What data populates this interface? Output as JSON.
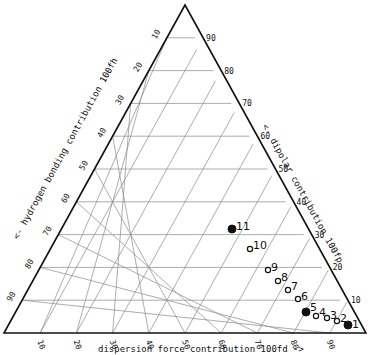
{
  "chart_data": {
    "type": "scatter",
    "subtype": "ternary",
    "title": "",
    "axes": {
      "bottom": {
        "label": "dispersion force contribution 100fd ->",
        "ticks": [
          "10",
          "20",
          "30",
          "40",
          "50",
          "60",
          "70",
          "80",
          "90"
        ]
      },
      "left": {
        "label": "<- hydrogen bonding contribution 100fh",
        "ticks": [
          "10",
          "20",
          "30",
          "40",
          "50",
          "60",
          "70",
          "80",
          "90"
        ]
      },
      "right": {
        "label": "<- dipolar contribution 100fp",
        "ticks": [
          "10",
          "20",
          "30",
          "40",
          "50",
          "60",
          "70",
          "80",
          "90"
        ]
      }
    },
    "grid": true,
    "points": [
      {
        "label": "1",
        "fd": 94,
        "fp": 3,
        "fh": 3,
        "marker": "filled"
      },
      {
        "label": "2",
        "fd": 91,
        "fp": 4,
        "fh": 5,
        "marker": "open"
      },
      {
        "label": "3",
        "fd": 88,
        "fp": 5,
        "fh": 7,
        "marker": "open"
      },
      {
        "label": "4",
        "fd": 85,
        "fp": 5,
        "fh": 10,
        "marker": "open"
      },
      {
        "label": "5",
        "fd": 82,
        "fp": 6,
        "fh": 12,
        "marker": "filled"
      },
      {
        "label": "6",
        "fd": 79,
        "fp": 10,
        "fh": 11,
        "marker": "open"
      },
      {
        "label": "7",
        "fd": 75,
        "fp": 13,
        "fh": 12,
        "marker": "open"
      },
      {
        "label": "8",
        "fd": 71,
        "fp": 16,
        "fh": 13,
        "marker": "open"
      },
      {
        "label": "9",
        "fd": 67,
        "fp": 19,
        "fh": 14,
        "marker": "open"
      },
      {
        "label": "10",
        "fd": 59,
        "fp": 26,
        "fh": 15,
        "marker": "open"
      },
      {
        "label": "11",
        "fd": 51,
        "fp": 32,
        "fh": 17,
        "marker": "filled"
      }
    ]
  },
  "geometry": {
    "apex": [
      185,
      5
    ],
    "left": [
      4,
      333
    ],
    "right": [
      366,
      333
    ]
  },
  "points_px": [
    {
      "label": "1",
      "x": 348,
      "y": 325,
      "marker": "filled",
      "lx": 352,
      "ly": 328
    },
    {
      "label": "2",
      "x": 337,
      "y": 321,
      "marker": "open",
      "lx": 340,
      "ly": 322
    },
    {
      "label": "3",
      "x": 327,
      "y": 318,
      "marker": "open",
      "lx": 330,
      "ly": 319
    },
    {
      "label": "4",
      "x": 316,
      "y": 316,
      "marker": "open",
      "lx": 319,
      "ly": 316
    },
    {
      "label": "5",
      "x": 306,
      "y": 312,
      "marker": "filled",
      "lx": 310,
      "ly": 311
    },
    {
      "label": "6",
      "x": 298,
      "y": 299,
      "marker": "open",
      "lx": 301,
      "ly": 300
    },
    {
      "label": "7",
      "x": 288,
      "y": 290,
      "marker": "open",
      "lx": 291,
      "ly": 290
    },
    {
      "label": "8",
      "x": 278,
      "y": 281,
      "marker": "open",
      "lx": 281,
      "ly": 281
    },
    {
      "label": "9",
      "x": 268,
      "y": 270,
      "marker": "open",
      "lx": 271,
      "ly": 271
    },
    {
      "label": "10",
      "x": 250,
      "y": 249,
      "marker": "open",
      "lx": 253,
      "ly": 249
    },
    {
      "label": "11",
      "x": 232,
      "y": 229,
      "marker": "filled",
      "lx": 236,
      "ly": 230
    }
  ]
}
